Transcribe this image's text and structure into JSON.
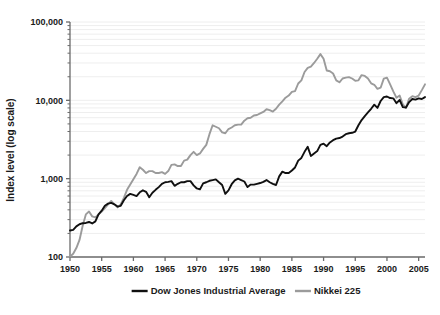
{
  "chart_data": {
    "type": "line",
    "title": "",
    "xlabel": "",
    "ylabel": "Index level (log scale)",
    "yscale": "log",
    "ylim": [
      100,
      100000
    ],
    "xlim": [
      1950,
      2006
    ],
    "grid": true,
    "grid_orientation": "horizontal",
    "legend_position": "bottom-center",
    "y_major_ticks": [
      100,
      1000,
      10000,
      100000
    ],
    "y_major_tick_labels": [
      "100",
      "1,000",
      "10,000",
      "100,000"
    ],
    "y_minor_ticks_per_decade": [
      2,
      3,
      4,
      5,
      6,
      7,
      8,
      9
    ],
    "x_ticks": [
      1950,
      1955,
      1960,
      1965,
      1970,
      1975,
      1980,
      1985,
      1990,
      1995,
      2000,
      2005
    ],
    "x_tick_labels": [
      "1950",
      "1955",
      "1960",
      "1965",
      "1970",
      "1975",
      "1980",
      "1985",
      "1990",
      "1995",
      "2000",
      "2005"
    ],
    "series": [
      {
        "name": "Dow Jones Industrial Average",
        "color": "#101010",
        "width": 1.9,
        "x": [
          1950.0,
          1950.5,
          1951.0,
          1951.5,
          1952.0,
          1952.5,
          1953.0,
          1953.5,
          1954.0,
          1954.5,
          1955.0,
          1955.5,
          1956.0,
          1956.5,
          1957.0,
          1957.5,
          1958.0,
          1958.5,
          1959.0,
          1959.5,
          1960.0,
          1960.5,
          1961.0,
          1961.5,
          1962.0,
          1962.5,
          1963.0,
          1963.5,
          1964.0,
          1964.5,
          1965.0,
          1965.5,
          1966.0,
          1966.5,
          1967.0,
          1967.5,
          1968.0,
          1968.5,
          1969.0,
          1969.5,
          1970.0,
          1970.5,
          1971.0,
          1971.5,
          1972.0,
          1972.5,
          1973.0,
          1973.5,
          1974.0,
          1974.5,
          1975.0,
          1975.5,
          1976.0,
          1976.5,
          1977.0,
          1977.5,
          1978.0,
          1978.5,
          1979.0,
          1979.5,
          1980.0,
          1980.5,
          1981.0,
          1981.5,
          1982.0,
          1982.5,
          1983.0,
          1983.5,
          1984.0,
          1984.5,
          1985.0,
          1985.5,
          1986.0,
          1986.5,
          1987.0,
          1987.5,
          1988.0,
          1988.5,
          1989.0,
          1989.5,
          1990.0,
          1990.5,
          1991.0,
          1991.5,
          1992.0,
          1992.5,
          1993.0,
          1993.5,
          1994.0,
          1994.5,
          1995.0,
          1995.5,
          1996.0,
          1996.5,
          1997.0,
          1997.5,
          1998.0,
          1998.5,
          1999.0,
          1999.5,
          2000.0,
          2000.5,
          2001.0,
          2001.5,
          2002.0,
          2002.5,
          2003.0,
          2003.5,
          2004.0,
          2004.5,
          2005.0,
          2005.5,
          2006.0
        ],
        "y": [
          218,
          222,
          246,
          262,
          270,
          272,
          280,
          268,
          285,
          350,
          390,
          450,
          480,
          490,
          470,
          440,
          450,
          530,
          600,
          640,
          620,
          600,
          670,
          710,
          680,
          580,
          660,
          720,
          780,
          860,
          900,
          910,
          930,
          810,
          860,
          900,
          900,
          930,
          930,
          820,
          750,
          730,
          870,
          900,
          940,
          960,
          980,
          900,
          830,
          640,
          710,
          850,
          950,
          1000,
          960,
          920,
          780,
          840,
          840,
          860,
          880,
          910,
          960,
          900,
          860,
          830,
          1070,
          1230,
          1180,
          1180,
          1270,
          1390,
          1700,
          1840,
          2200,
          2550,
          1950,
          2100,
          2250,
          2700,
          2800,
          2600,
          2900,
          3100,
          3250,
          3300,
          3450,
          3700,
          3800,
          3850,
          4000,
          4800,
          5600,
          6300,
          7000,
          7800,
          8800,
          8000,
          9800,
          11000,
          11200,
          10700,
          10600,
          9200,
          10100,
          8200,
          8100,
          9500,
          10400,
          10200,
          10600,
          10400,
          11000
        ]
      },
      {
        "name": "Nikkei 225",
        "color": "#9b9b9b",
        "width": 1.9,
        "x": [
          1950.0,
          1950.5,
          1951.0,
          1951.5,
          1952.0,
          1952.5,
          1953.0,
          1953.5,
          1954.0,
          1954.5,
          1955.0,
          1955.5,
          1956.0,
          1956.5,
          1957.0,
          1957.5,
          1958.0,
          1958.5,
          1959.0,
          1959.5,
          1960.0,
          1960.5,
          1961.0,
          1961.5,
          1962.0,
          1962.5,
          1963.0,
          1963.5,
          1964.0,
          1964.5,
          1965.0,
          1965.5,
          1966.0,
          1966.5,
          1967.0,
          1967.5,
          1968.0,
          1968.5,
          1969.0,
          1969.5,
          1970.0,
          1970.5,
          1971.0,
          1971.5,
          1972.0,
          1972.5,
          1973.0,
          1973.5,
          1974.0,
          1974.5,
          1975.0,
          1975.5,
          1976.0,
          1976.5,
          1977.0,
          1977.5,
          1978.0,
          1978.5,
          1979.0,
          1979.5,
          1980.0,
          1980.5,
          1981.0,
          1981.5,
          1982.0,
          1982.5,
          1983.0,
          1983.5,
          1984.0,
          1984.5,
          1985.0,
          1985.5,
          1986.0,
          1986.5,
          1987.0,
          1987.5,
          1988.0,
          1988.5,
          1989.0,
          1989.5,
          1990.0,
          1990.5,
          1991.0,
          1991.5,
          1992.0,
          1992.5,
          1993.0,
          1993.5,
          1994.0,
          1994.5,
          1995.0,
          1995.5,
          1996.0,
          1996.5,
          1997.0,
          1997.5,
          1998.0,
          1998.5,
          1999.0,
          1999.5,
          2000.0,
          2000.5,
          2001.0,
          2001.5,
          2002.0,
          2002.5,
          2003.0,
          2003.5,
          2004.0,
          2004.5,
          2005.0,
          2005.5,
          2006.0
        ],
        "y": [
          101,
          110,
          130,
          165,
          250,
          350,
          380,
          330,
          320,
          350,
          380,
          420,
          470,
          520,
          470,
          430,
          470,
          570,
          720,
          840,
          980,
          1150,
          1400,
          1300,
          1180,
          1250,
          1250,
          1180,
          1180,
          1210,
          1150,
          1250,
          1500,
          1520,
          1450,
          1450,
          1700,
          1750,
          2000,
          2200,
          2000,
          2100,
          2400,
          2700,
          3700,
          4800,
          4600,
          4400,
          3900,
          3800,
          4300,
          4500,
          4800,
          4900,
          4900,
          5500,
          5900,
          6000,
          6400,
          6500,
          6800,
          7100,
          7700,
          7500,
          7200,
          7800,
          8800,
          9700,
          10800,
          11500,
          12800,
          13100,
          16400,
          18000,
          23000,
          26000,
          27000,
          30000,
          34000,
          38900,
          34000,
          24000,
          23500,
          22000,
          18000,
          17000,
          19000,
          19500,
          19800,
          19000,
          17800,
          18000,
          21000,
          20500,
          19000,
          16500,
          15800,
          14000,
          14500,
          18900,
          19500,
          16000,
          13000,
          10800,
          11500,
          8900,
          8000,
          10500,
          11300,
          11000,
          11500,
          13500,
          16000
        ]
      }
    ],
    "annotations": []
  },
  "legend": {
    "items": [
      {
        "label": "Dow Jones Industrial Average",
        "color": "#101010"
      },
      {
        "label": "Nikkei 225",
        "color": "#9b9b9b"
      }
    ]
  },
  "colors": {
    "background": "#ffffff",
    "axis": "#6b6b6b",
    "gridline": "#eeeeee",
    "text": "#1a1a1a",
    "dow": "#101010",
    "nikkei": "#9b9b9b"
  }
}
